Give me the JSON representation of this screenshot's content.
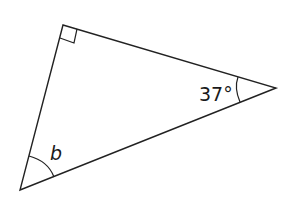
{
  "diagram": {
    "type": "triangle",
    "vertices": {
      "top": {
        "x": 63,
        "y": 25,
        "angle": "right angle"
      },
      "right": {
        "x": 276,
        "y": 88,
        "angle": "37°"
      },
      "bottom": {
        "x": 20,
        "y": 190,
        "angle": "b"
      }
    },
    "labels": {
      "right_angle": "37°",
      "bottom_angle": "b"
    },
    "stroke_color": "#222222"
  }
}
